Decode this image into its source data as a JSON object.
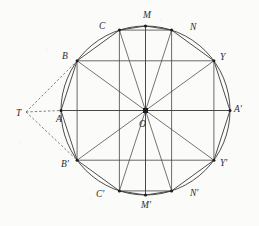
{
  "figure": {
    "background_color": "#fbfbfa",
    "stroke_color": "#3a3a3a",
    "dash_color": "#4a4a4a",
    "circle": {
      "cx": 145.5,
      "cy": 110.5,
      "r": 84.5
    },
    "center_point": {
      "label": "O",
      "x": 145.5,
      "y": 110.5,
      "label_x": 139,
      "label_y": 127
    },
    "external_point": {
      "label": "T",
      "x": 26,
      "y": 112,
      "label_x": 16,
      "label_y": 116
    },
    "vertices": [
      {
        "label": "A'",
        "x": 230.0,
        "y": 110.5,
        "label_x": 234,
        "label_y": 112
      },
      {
        "label": "Y",
        "x": 213.9,
        "y": 60.8,
        "label_x": 220,
        "label_y": 60
      },
      {
        "label": "N",
        "x": 171.6,
        "y": 30.1,
        "label_x": 190,
        "label_y": 30
      },
      {
        "label": "M",
        "x": 145.5,
        "y": 26.0,
        "label_x": 143,
        "label_y": 18
      },
      {
        "label": "C",
        "x": 119.4,
        "y": 30.1,
        "label_x": 99,
        "label_y": 29
      },
      {
        "label": "B",
        "x": 77.1,
        "y": 60.8,
        "label_x": 62,
        "label_y": 59
      },
      {
        "label": "A",
        "x": 61.0,
        "y": 110.5,
        "label_x": 56,
        "label_y": 122
      },
      {
        "label": "B'",
        "x": 77.1,
        "y": 160.2,
        "label_x": 61,
        "label_y": 167
      },
      {
        "label": "C'",
        "x": 119.4,
        "y": 190.9,
        "label_x": 96,
        "label_y": 197
      },
      {
        "label": "M'",
        "x": 145.5,
        "y": 195.0,
        "label_x": 141,
        "label_y": 208
      },
      {
        "label": "N'",
        "x": 171.6,
        "y": 190.9,
        "label_x": 190,
        "label_y": 196
      },
      {
        "label": "Y'",
        "x": 213.9,
        "y": 160.2,
        "label_x": 220,
        "label_y": 166
      }
    ],
    "dashed_lines": [
      {
        "name": "T-to-B",
        "from": "T",
        "to": "B"
      },
      {
        "name": "T-to-A",
        "from": "T",
        "to": "A"
      },
      {
        "name": "T-to-B-prime",
        "from": "T",
        "to": "B'"
      }
    ],
    "chords": [
      [
        "B",
        "Y"
      ],
      [
        "C",
        "N"
      ],
      [
        "B'",
        "Y'"
      ],
      [
        "C'",
        "N'"
      ],
      [
        "B",
        "B'"
      ],
      [
        "C",
        "C'"
      ],
      [
        "M",
        "M'"
      ],
      [
        "N",
        "N'"
      ],
      [
        "Y",
        "Y'"
      ],
      [
        "A",
        "A'"
      ]
    ],
    "radii": [
      [
        "O",
        "M"
      ],
      [
        "O",
        "N"
      ],
      [
        "O",
        "Y"
      ],
      [
        "O",
        "A'"
      ],
      [
        "O",
        "Y'"
      ],
      [
        "O",
        "N'"
      ],
      [
        "O",
        "M'"
      ],
      [
        "O",
        "C'"
      ],
      [
        "O",
        "B'"
      ],
      [
        "O",
        "A"
      ],
      [
        "O",
        "B"
      ],
      [
        "O",
        "C"
      ]
    ],
    "polygon_edges": [
      [
        "A'",
        "Y"
      ],
      [
        "Y",
        "N"
      ],
      [
        "N",
        "M"
      ],
      [
        "M",
        "C"
      ],
      [
        "C",
        "B"
      ],
      [
        "B",
        "A"
      ],
      [
        "A",
        "B'"
      ],
      [
        "B'",
        "C'"
      ],
      [
        "C'",
        "M'"
      ],
      [
        "M'",
        "N'"
      ],
      [
        "N'",
        "Y'"
      ],
      [
        "Y'",
        "A'"
      ]
    ]
  }
}
